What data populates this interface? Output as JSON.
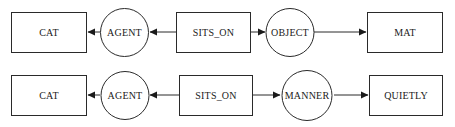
{
  "diagram": {
    "type": "conceptual-graph",
    "rows": [
      {
        "nodes": [
          {
            "id": "cat",
            "kind": "concept",
            "label": "CAT"
          },
          {
            "id": "agent",
            "kind": "relation",
            "label": "AGENT"
          },
          {
            "id": "sits_on",
            "kind": "concept",
            "label": "SITS_ON"
          },
          {
            "id": "object",
            "kind": "relation",
            "label": "OBJECT"
          },
          {
            "id": "mat",
            "kind": "concept",
            "label": "MAT"
          }
        ],
        "edges": [
          {
            "from": "agent",
            "to": "cat"
          },
          {
            "from": "sits_on",
            "to": "agent"
          },
          {
            "from": "sits_on",
            "to": "object"
          },
          {
            "from": "object",
            "to": "mat"
          }
        ]
      },
      {
        "nodes": [
          {
            "id": "cat",
            "kind": "concept",
            "label": "CAT"
          },
          {
            "id": "agent",
            "kind": "relation",
            "label": "AGENT"
          },
          {
            "id": "sits_on",
            "kind": "concept",
            "label": "SITS_ON"
          },
          {
            "id": "manner",
            "kind": "relation",
            "label": "MANNER"
          },
          {
            "id": "quietly",
            "kind": "concept",
            "label": "QUIETLY"
          }
        ],
        "edges": [
          {
            "from": "agent",
            "to": "cat"
          },
          {
            "from": "sits_on",
            "to": "agent"
          },
          {
            "from": "sits_on",
            "to": "manner"
          },
          {
            "from": "manner",
            "to": "quietly"
          }
        ]
      }
    ]
  }
}
